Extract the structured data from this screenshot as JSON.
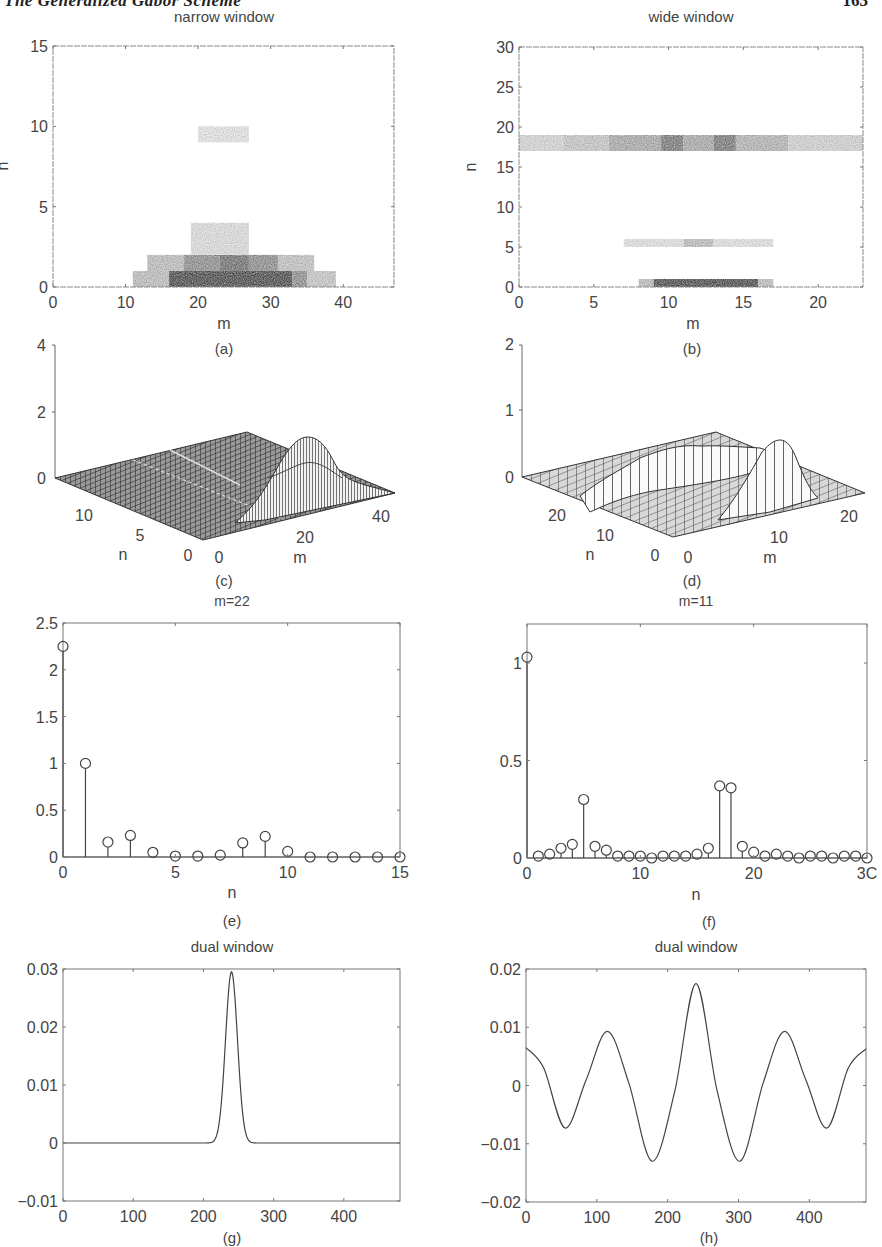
{
  "page": {
    "running_title": "The Generalized Gabor Scheme",
    "page_number": "163"
  },
  "colors": {
    "axis": "#6a6a6a",
    "line": "#4a4a4a",
    "text": "#444444",
    "heat_dark": "#2e2e2e"
  },
  "chart_data": [
    {
      "id": "a",
      "type": "heatmap",
      "title": "narrow window",
      "caption": "(a)",
      "xlabel": "m",
      "ylabel": "n",
      "xlim": [
        0,
        47
      ],
      "ylim": [
        0,
        15
      ],
      "xticks": [
        0,
        10,
        20,
        30,
        40
      ],
      "yticks": [
        0,
        5,
        10,
        15
      ],
      "grid": false,
      "cells": [
        {
          "m0": 11,
          "m1": 16,
          "n0": 0,
          "n1": 1,
          "v": 0.25
        },
        {
          "m0": 16,
          "m1": 33,
          "n0": 0,
          "n1": 1,
          "v": 0.85
        },
        {
          "m0": 33,
          "m1": 35,
          "n0": 0,
          "n1": 1,
          "v": 0.5
        },
        {
          "m0": 35,
          "m1": 39,
          "n0": 0,
          "n1": 1,
          "v": 0.2
        },
        {
          "m0": 13,
          "m1": 18,
          "n0": 1,
          "n1": 2,
          "v": 0.25
        },
        {
          "m0": 18,
          "m1": 23,
          "n0": 1,
          "n1": 2,
          "v": 0.5
        },
        {
          "m0": 23,
          "m1": 27,
          "n0": 1,
          "n1": 2,
          "v": 0.65
        },
        {
          "m0": 27,
          "m1": 31,
          "n0": 1,
          "n1": 2,
          "v": 0.5
        },
        {
          "m0": 31,
          "m1": 36,
          "n0": 1,
          "n1": 2,
          "v": 0.22
        },
        {
          "m0": 19,
          "m1": 27,
          "n0": 2,
          "n1": 4,
          "v": 0.08
        },
        {
          "m0": 20,
          "m1": 27,
          "n0": 9,
          "n1": 10,
          "v": 0.04
        }
      ]
    },
    {
      "id": "b",
      "type": "heatmap",
      "title": "wide window",
      "caption": "(b)",
      "xlabel": "m",
      "ylabel": "n",
      "xlim": [
        0,
        23
      ],
      "ylim": [
        0,
        30
      ],
      "xticks": [
        0,
        5,
        10,
        15,
        20
      ],
      "yticks": [
        0,
        5,
        10,
        15,
        20,
        25,
        30
      ],
      "grid": false,
      "cells": [
        {
          "m0": 0,
          "m1": 3,
          "n0": 17,
          "n1": 19,
          "v": 0.12
        },
        {
          "m0": 3,
          "m1": 6,
          "n0": 17,
          "n1": 19,
          "v": 0.2
        },
        {
          "m0": 6,
          "m1": 9.5,
          "n0": 17,
          "n1": 19,
          "v": 0.35
        },
        {
          "m0": 9.5,
          "m1": 11,
          "n0": 17,
          "n1": 19,
          "v": 0.6
        },
        {
          "m0": 11,
          "m1": 13,
          "n0": 17,
          "n1": 19,
          "v": 0.35
        },
        {
          "m0": 13,
          "m1": 14.5,
          "n0": 17,
          "n1": 19,
          "v": 0.6
        },
        {
          "m0": 14.5,
          "m1": 18,
          "n0": 17,
          "n1": 19,
          "v": 0.3
        },
        {
          "m0": 18,
          "m1": 23,
          "n0": 17,
          "n1": 19,
          "v": 0.14
        },
        {
          "m0": 7,
          "m1": 11,
          "n0": 5,
          "n1": 6,
          "v": 0.06
        },
        {
          "m0": 11,
          "m1": 13,
          "n0": 5,
          "n1": 6,
          "v": 0.25
        },
        {
          "m0": 13,
          "m1": 17,
          "n0": 5,
          "n1": 6,
          "v": 0.06
        },
        {
          "m0": 8,
          "m1": 9,
          "n0": 0,
          "n1": 1,
          "v": 0.25
        },
        {
          "m0": 9,
          "m1": 16,
          "n0": 0,
          "n1": 1,
          "v": 0.85
        },
        {
          "m0": 16,
          "m1": 17,
          "n0": 0,
          "n1": 1,
          "v": 0.25
        }
      ]
    },
    {
      "id": "c",
      "type": "surface3d",
      "caption": "(c)",
      "xlabel": "m",
      "ylabel": "n",
      "zlabel": "",
      "xticks": [
        0,
        20,
        40
      ],
      "yticks": [
        0,
        5,
        10
      ],
      "zticks": [
        0,
        2,
        4
      ],
      "zlim": [
        0,
        4
      ],
      "peak": {
        "m": 22,
        "n": 0,
        "z": 2.25
      }
    },
    {
      "id": "d",
      "type": "surface3d",
      "caption": "(d)",
      "xlabel": "m",
      "ylabel": "n",
      "zlabel": "",
      "xticks": [
        0,
        10,
        20
      ],
      "yticks": [
        0,
        10,
        20
      ],
      "zticks": [
        0,
        1,
        2
      ],
      "zlim": [
        0,
        2
      ],
      "peak": {
        "m": 11,
        "n": 0,
        "z": 1.03
      },
      "ridge": {
        "n": 18,
        "z": 0.37
      }
    },
    {
      "id": "e",
      "type": "stem",
      "title": "m=22",
      "caption": "(e)",
      "xlabel": "n",
      "ylabel": "",
      "xlim": [
        0,
        15
      ],
      "ylim": [
        0,
        2.5
      ],
      "xticks": [
        0,
        5,
        10,
        15
      ],
      "yticks": [
        0,
        0.5,
        1,
        1.5,
        2,
        2.5
      ],
      "x": [
        0,
        1,
        2,
        3,
        4,
        5,
        6,
        7,
        8,
        9,
        10,
        11,
        12,
        13,
        14,
        15
      ],
      "values": [
        2.25,
        1.0,
        0.16,
        0.23,
        0.05,
        0.01,
        0.01,
        0.02,
        0.15,
        0.22,
        0.06,
        0.0,
        0.0,
        0.0,
        0.0,
        0.0
      ]
    },
    {
      "id": "f",
      "type": "stem",
      "title": "m=11",
      "caption": "(f)",
      "xlabel": "n",
      "ylabel": "",
      "xlim": [
        0,
        30
      ],
      "ylim": [
        0,
        1.2
      ],
      "xticks": [
        0,
        10,
        20,
        30
      ],
      "xtick_labels": [
        "0",
        "10",
        "20",
        "3C"
      ],
      "yticks": [
        0,
        0.5,
        1
      ],
      "x": [
        0,
        1,
        2,
        3,
        4,
        5,
        6,
        7,
        8,
        9,
        10,
        11,
        12,
        13,
        14,
        15,
        16,
        17,
        18,
        19,
        20,
        21,
        22,
        23,
        24,
        25,
        26,
        27,
        28,
        29,
        30
      ],
      "values": [
        1.03,
        0.01,
        0.02,
        0.05,
        0.07,
        0.3,
        0.06,
        0.04,
        0.01,
        0.01,
        0.01,
        0.0,
        0.01,
        0.01,
        0.01,
        0.02,
        0.05,
        0.37,
        0.36,
        0.06,
        0.03,
        0.01,
        0.02,
        0.01,
        0.0,
        0.01,
        0.01,
        0.0,
        0.01,
        0.01,
        0.0
      ]
    },
    {
      "id": "g",
      "type": "line",
      "title": "dual window",
      "caption": "(g)",
      "xlabel": "",
      "ylabel": "",
      "xlim": [
        0,
        480
      ],
      "ylim": [
        -0.01,
        0.03
      ],
      "xticks": [
        0,
        100,
        200,
        300,
        400
      ],
      "yticks": [
        -0.01,
        0,
        0.01,
        0.02,
        0.03
      ],
      "ytick_labels": [
        "−0.01",
        "0",
        "0.01",
        "0.02",
        "0.03"
      ],
      "series": [
        {
          "name": "dual window",
          "shape": "gaussian",
          "center": 240,
          "peak": 0.0295,
          "sigma": 8.5
        }
      ]
    },
    {
      "id": "h",
      "type": "line",
      "title": "dual window",
      "caption": "(h)",
      "xlabel": "",
      "ylabel": "",
      "xlim": [
        0,
        480
      ],
      "ylim": [
        -0.02,
        0.02
      ],
      "xticks": [
        0,
        100,
        200,
        300,
        400
      ],
      "yticks": [
        -0.02,
        -0.01,
        0,
        0.01,
        0.02
      ],
      "ytick_labels": [
        "−0.02",
        "−0.01",
        "0",
        "0.01",
        "0.02"
      ],
      "series": [
        {
          "name": "dual window",
          "x": [
            0,
            25,
            55,
            85,
            115,
            145,
            178,
            210,
            240,
            270,
            302,
            335,
            365,
            395,
            425,
            455,
            480
          ],
          "y": [
            0.0065,
            0.003,
            -0.0073,
            0.001,
            0.0093,
            0.0005,
            -0.013,
            -0.001,
            0.0175,
            -0.001,
            -0.013,
            0.0005,
            0.0093,
            0.001,
            -0.0073,
            0.003,
            0.0063
          ]
        }
      ]
    }
  ]
}
